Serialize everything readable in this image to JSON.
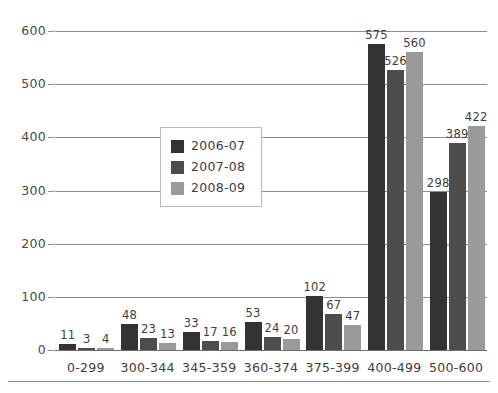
{
  "chart_data": {
    "type": "bar",
    "title": "",
    "xlabel": "",
    "ylabel": "",
    "grid": true,
    "legend_position": "inside-center-left",
    "ylim": [
      0,
      600
    ],
    "yticks": [
      "0",
      "100",
      "200",
      "300",
      "400",
      "500",
      "600"
    ],
    "ytick_values": [
      0,
      100,
      200,
      300,
      400,
      500,
      600
    ],
    "categories": [
      "0-299",
      "300-344",
      "345-359",
      "360-374",
      "375-399",
      "400-499",
      "500-600"
    ],
    "series": [
      {
        "name": "2006-07",
        "color": "#333333",
        "values": [
          11,
          48,
          33,
          53,
          102,
          575,
          298
        ]
      },
      {
        "name": "2007-08",
        "color": "#4d4d4d",
        "values": [
          3,
          23,
          17,
          24,
          67,
          526,
          389
        ]
      },
      {
        "name": "2008-09",
        "color": "#9a9a9a",
        "values": [
          4,
          13,
          16,
          20,
          47,
          560,
          422
        ]
      }
    ],
    "data_labels": [
      [
        "11",
        "3",
        "4"
      ],
      [
        "48",
        "23",
        "13"
      ],
      [
        "33",
        "17",
        "16"
      ],
      [
        "53",
        "24",
        "20"
      ],
      [
        "102",
        "67",
        "47"
      ],
      [
        "575",
        "526",
        "560"
      ],
      [
        "298",
        "389",
        "422"
      ]
    ]
  },
  "legend": {
    "entries": [
      {
        "label": "2006-07"
      },
      {
        "label": "2007-08"
      },
      {
        "label": "2008-09"
      }
    ]
  }
}
